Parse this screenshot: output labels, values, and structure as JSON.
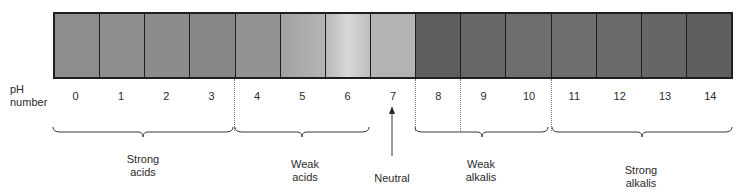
{
  "diagram": {
    "axis_label": "pH number",
    "axis_label_lines": [
      "pH",
      "number"
    ],
    "scale": [
      {
        "ph": "0",
        "color": "#8d8d8d"
      },
      {
        "ph": "1",
        "color": "#8e8e8e"
      },
      {
        "ph": "2",
        "color": "#8c8c8c"
      },
      {
        "ph": "3",
        "color": "#878787"
      },
      {
        "ph": "4",
        "color": "#939393"
      },
      {
        "ph": "5",
        "color": "#a6a6a6"
      },
      {
        "ph": "6",
        "color": "#c4c4c4"
      },
      {
        "ph": "7",
        "color": "#b3b3b3"
      },
      {
        "ph": "8",
        "color": "#5e5e5e"
      },
      {
        "ph": "9",
        "color": "#676767"
      },
      {
        "ph": "10",
        "color": "#6e6e6e"
      },
      {
        "ph": "11",
        "color": "#6f6f6f"
      },
      {
        "ph": "12",
        "color": "#6a6a6a"
      },
      {
        "ph": "13",
        "color": "#666666"
      },
      {
        "ph": "14",
        "color": "#5f5f5f"
      }
    ],
    "groups": [
      {
        "label_line1": "Strong",
        "label_line2": "acids",
        "range": "0-3"
      },
      {
        "label_line1": "Weak",
        "label_line2": "acids",
        "range": "4-6"
      },
      {
        "label_line1": "Neutral",
        "label_line2": "",
        "range": "7"
      },
      {
        "label_line1": "Weak",
        "label_line2": "alkalis",
        "range": "8-10"
      },
      {
        "label_line1": "Strong",
        "label_line2": "alkalis",
        "range": "11-14"
      }
    ]
  }
}
